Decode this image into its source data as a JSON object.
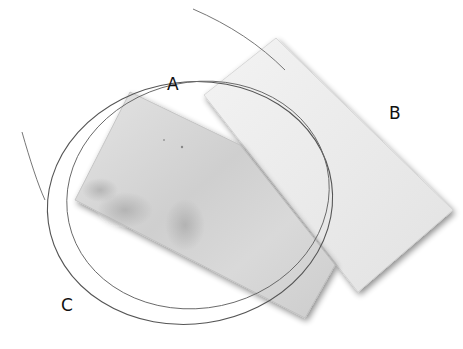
{
  "figure": {
    "labels": [
      {
        "id": "A",
        "text": "A",
        "x": 167,
        "y": 76
      },
      {
        "id": "B",
        "text": "B",
        "x": 389,
        "y": 105
      },
      {
        "id": "C",
        "text": "C",
        "x": 61,
        "y": 297
      }
    ],
    "objects": [
      {
        "name": "sheet-a",
        "label": "A",
        "fill": "#d8d8d8",
        "shading": "#b5b5b5"
      },
      {
        "name": "sheet-b",
        "label": "B",
        "fill": "#ececec",
        "shading": "#d6d6d6"
      },
      {
        "name": "wire-coil",
        "label": "C",
        "stroke": "#555555"
      }
    ],
    "background": "#ffffff"
  }
}
